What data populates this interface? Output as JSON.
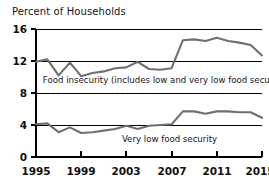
{
  "chart_data": {
    "type": "line",
    "title": "Percent of Households",
    "xlabel": "",
    "ylabel": "Percent of Households",
    "ylim": [
      0,
      16
    ],
    "xlim": [
      1995,
      2015
    ],
    "yticks": [
      0,
      4,
      8,
      12,
      16
    ],
    "ytick_labels": [
      "0",
      "4",
      "8",
      "12",
      "16"
    ],
    "xticks": [
      1995,
      1999,
      2003,
      2007,
      2011,
      2015
    ],
    "xtick_labels": [
      "1995",
      "1999",
      "2003",
      "2007",
      "2011",
      "2015"
    ],
    "grid": true,
    "grid_axis": "y",
    "legend": "none",
    "line_color": "#6f6f6f",
    "axis_color": "#000000",
    "x": [
      1995,
      1996,
      1997,
      1998,
      1999,
      2000,
      2001,
      2002,
      2003,
      2004,
      2005,
      2006,
      2007,
      2008,
      2009,
      2010,
      2011,
      2012,
      2013,
      2014,
      2015
    ],
    "series": [
      {
        "name": "Food insecurity (includes low and very low food security)",
        "values": [
          11.9,
          12.2,
          10.2,
          11.8,
          10.1,
          10.5,
          10.7,
          11.1,
          11.2,
          11.9,
          11.0,
          10.9,
          11.1,
          14.6,
          14.7,
          14.5,
          14.9,
          14.5,
          14.3,
          14.0,
          12.7
        ]
      },
      {
        "name": "Very low food security",
        "values": [
          4.1,
          4.2,
          3.1,
          3.7,
          3.0,
          3.1,
          3.3,
          3.5,
          3.9,
          3.5,
          3.9,
          4.0,
          4.1,
          5.7,
          5.7,
          5.4,
          5.7,
          5.7,
          5.6,
          5.6,
          4.9
        ]
      }
    ],
    "annotations": [
      {
        "text": "Food insecurity (includes low and very low food security)",
        "x": 1995.6,
        "y": 9.2
      },
      {
        "text": "Very low food security",
        "x": 2002.6,
        "y": 1.9
      }
    ]
  }
}
